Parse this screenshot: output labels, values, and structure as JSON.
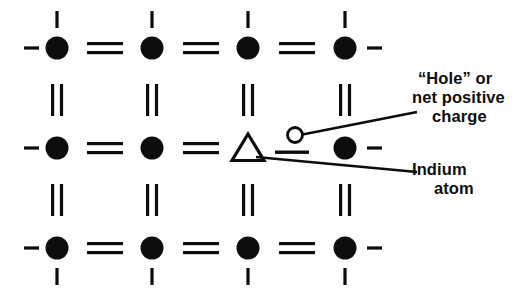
{
  "figure": {
    "width": 529,
    "height": 302,
    "background": "#ffffff",
    "ink_color": "#0d0d0d"
  },
  "annotations": {
    "hole": {
      "name": "hole-label",
      "lines": [
        "“Hole” or",
        "net positive",
        "charge"
      ],
      "full_text": "“Hole” or net positive charge",
      "leader_from": {
        "x": 303,
        "y": 135
      },
      "leader_to": {
        "x": 417,
        "y": 112
      }
    },
    "indium": {
      "name": "indium-label",
      "lines": [
        "Indium",
        "atom"
      ],
      "full_text": "Indium atom",
      "leader_from": {
        "x": 258,
        "y": 158
      },
      "leader_to": {
        "x": 417,
        "y": 172
      }
    }
  },
  "lattice": {
    "columns_x": [
      57,
      152,
      248,
      345
    ],
    "rows_y": [
      48,
      148,
      248
    ],
    "atom_radius": 11.5,
    "stub_dash_len": 15,
    "stub_tick_len": 17,
    "bond_gap": 4.5,
    "bond_thickness": 3.2,
    "horizontal_bond_len": 36,
    "vertical_bond_len": 32,
    "sites": [
      [
        {
          "type": "atom",
          "symbol": "silicon-atom"
        },
        {
          "type": "atom",
          "symbol": "silicon-atom"
        },
        {
          "type": "atom",
          "symbol": "silicon-atom"
        },
        {
          "type": "atom",
          "symbol": "silicon-atom"
        }
      ],
      [
        {
          "type": "atom",
          "symbol": "silicon-atom"
        },
        {
          "type": "atom",
          "symbol": "silicon-atom"
        },
        {
          "type": "triangle",
          "symbol": "indium-atom"
        },
        {
          "type": "atom",
          "symbol": "silicon-atom"
        }
      ],
      [
        {
          "type": "atom",
          "symbol": "silicon-atom"
        },
        {
          "type": "atom",
          "symbol": "silicon-atom"
        },
        {
          "type": "atom",
          "symbol": "silicon-atom"
        },
        {
          "type": "atom",
          "symbol": "silicon-atom"
        }
      ]
    ],
    "horizontal_bonds": [
      {
        "row": 0,
        "between": [
          0,
          1
        ],
        "order": 2
      },
      {
        "row": 0,
        "between": [
          1,
          2
        ],
        "order": 2
      },
      {
        "row": 0,
        "between": [
          2,
          3
        ],
        "order": 2
      },
      {
        "row": 1,
        "between": [
          0,
          1
        ],
        "order": 2
      },
      {
        "row": 1,
        "between": [
          1,
          2
        ],
        "order": 2
      },
      {
        "row": 1,
        "between": [
          2,
          3
        ],
        "order": 1
      },
      {
        "row": 2,
        "between": [
          0,
          1
        ],
        "order": 2
      },
      {
        "row": 2,
        "between": [
          1,
          2
        ],
        "order": 2
      },
      {
        "row": 2,
        "between": [
          2,
          3
        ],
        "order": 2
      }
    ],
    "vertical_bonds": [
      {
        "col": 0,
        "between": [
          0,
          1
        ],
        "order": 2
      },
      {
        "col": 1,
        "between": [
          0,
          1
        ],
        "order": 2
      },
      {
        "col": 2,
        "between": [
          0,
          1
        ],
        "order": 2
      },
      {
        "col": 3,
        "between": [
          0,
          1
        ],
        "order": 2
      },
      {
        "col": 0,
        "between": [
          1,
          2
        ],
        "order": 2
      },
      {
        "col": 1,
        "between": [
          1,
          2
        ],
        "order": 2
      },
      {
        "col": 2,
        "between": [
          1,
          2
        ],
        "order": 2
      },
      {
        "col": 3,
        "between": [
          1,
          2
        ],
        "order": 2
      }
    ],
    "edge_stubs": {
      "left_dashes_rows": [
        0,
        1,
        2
      ],
      "right_dashes_rows": [
        0,
        1,
        2
      ],
      "top_ticks_cols": [
        0,
        1,
        2,
        3
      ],
      "bottom_ticks_cols": [
        0,
        1,
        2,
        3
      ]
    }
  },
  "hole_marker": {
    "name": "hole-circle",
    "cx": 295,
    "cy": 135,
    "r": 7.5,
    "stroke_width": 2.8,
    "fill": "none"
  }
}
